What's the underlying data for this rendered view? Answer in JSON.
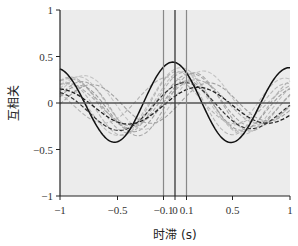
{
  "chart_data": {
    "type": "line",
    "title": "",
    "xlabel": "时滞 (s)",
    "ylabel": "互相关",
    "xlim": [
      -1,
      1
    ],
    "ylim": [
      -1,
      1
    ],
    "x_ticks": [
      -1,
      -0.5,
      -0.1,
      0,
      0.1,
      0.5,
      1
    ],
    "x_tick_labels": [
      "−1",
      "−0.5",
      "−0.1",
      "0",
      "0.1",
      "0.5",
      "1"
    ],
    "y_ticks": [
      1,
      0.5,
      0,
      -0.5,
      -1
    ],
    "y_tick_labels": [
      "1",
      "0.5",
      "0",
      "−0.5",
      "−1"
    ],
    "grid": false,
    "background": "#ececec",
    "reference_lines": {
      "horizontal": [
        {
          "y": 0,
          "color": "#555555",
          "width": 1.6
        }
      ],
      "vertical": [
        {
          "x": -0.1,
          "color": "#888888",
          "width": 1.2
        },
        {
          "x": 0,
          "color": "#444444",
          "width": 1.4
        },
        {
          "x": 0.1,
          "color": "#888888",
          "width": 1.2
        }
      ]
    },
    "series_description": "Cross-correlation curves: one solid black, two dark dashed, many light gray dashed; each modeled as amp*cos(2*pi*freq*(x-shift))*exp(-decay*x^2)+offset",
    "series": [
      {
        "name": "solid-black",
        "style": "solid",
        "color": "#111111",
        "width": 1.5,
        "amp": 0.44,
        "freq": 0.98,
        "shift": -0.02,
        "decay": 0.15,
        "offset": 0.0
      },
      {
        "name": "dashed-dark-1",
        "style": "dashed",
        "color": "#222222",
        "width": 1.3,
        "amp": 0.2,
        "freq": 0.82,
        "shift": 0.2,
        "decay": 0.1,
        "offset": -0.03
      },
      {
        "name": "dashed-dark-2",
        "style": "dashed",
        "color": "#333333",
        "width": 1.2,
        "amp": 0.27,
        "freq": 0.85,
        "shift": 0.09,
        "decay": 0.4,
        "offset": -0.05
      },
      {
        "name": "gray-1",
        "style": "dashed",
        "color": "#b0b0b0",
        "width": 1.1,
        "amp": 0.33,
        "freq": 1.0,
        "shift": 0.08,
        "decay": 0.2,
        "offset": 0.0
      },
      {
        "name": "gray-2",
        "style": "dashed",
        "color": "#a5a5a5",
        "width": 1.1,
        "amp": 0.3,
        "freq": 0.93,
        "shift": 0.14,
        "decay": 0.25,
        "offset": 0.02
      },
      {
        "name": "gray-3",
        "style": "dashed",
        "color": "#bdbdbd",
        "width": 1.1,
        "amp": 0.38,
        "freq": 0.9,
        "shift": 0.05,
        "decay": 0.35,
        "offset": 0.0
      },
      {
        "name": "gray-4",
        "style": "dashed",
        "color": "#9c9c9c",
        "width": 1.1,
        "amp": 0.28,
        "freq": 1.05,
        "shift": 0.11,
        "decay": 0.3,
        "offset": -0.04
      },
      {
        "name": "gray-5",
        "style": "dashed",
        "color": "#c4c4c4",
        "width": 1.1,
        "amp": 0.32,
        "freq": 0.95,
        "shift": 0.25,
        "decay": 0.3,
        "offset": 0.03
      },
      {
        "name": "gray-6",
        "style": "dashed",
        "color": "#aaaaaa",
        "width": 1.1,
        "amp": 0.25,
        "freq": 0.88,
        "shift": 0.18,
        "decay": 0.2,
        "offset": 0.0
      },
      {
        "name": "gray-7",
        "style": "dashed",
        "color": "#b7b7b7",
        "width": 1.1,
        "amp": 0.36,
        "freq": 1.02,
        "shift": 0.02,
        "decay": 0.45,
        "offset": -0.02
      },
      {
        "name": "gray-8",
        "style": "dashed",
        "color": "#a0a0a0",
        "width": 1.1,
        "amp": 0.22,
        "freq": 0.97,
        "shift": 0.3,
        "decay": 0.2,
        "offset": 0.0
      },
      {
        "name": "gray-9",
        "style": "dashed",
        "color": "#c0c0c0",
        "width": 1.1,
        "amp": 0.3,
        "freq": 1.1,
        "shift": 0.06,
        "decay": 0.3,
        "offset": 0.04
      },
      {
        "name": "gray-10",
        "style": "dashed",
        "color": "#b3b3b3",
        "width": 1.1,
        "amp": 0.26,
        "freq": 0.86,
        "shift": -0.05,
        "decay": 0.25,
        "offset": 0.02
      },
      {
        "name": "gray-11",
        "style": "dashed",
        "color": "#a8a8a8",
        "width": 1.1,
        "amp": 0.35,
        "freq": 1.0,
        "shift": 0.17,
        "decay": 0.5,
        "offset": -0.02
      }
    ]
  },
  "labels": {
    "ylabel": "互相关",
    "xlabel": "时滞 (s)"
  }
}
